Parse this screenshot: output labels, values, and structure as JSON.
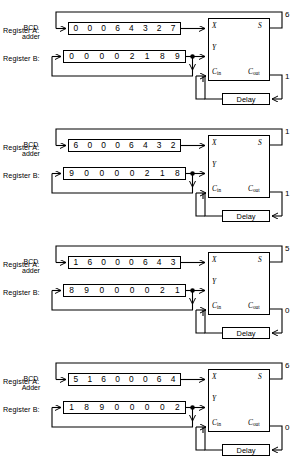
{
  "diagram": {
    "register_a_label": "Register A:",
    "register_b_label": "Register B:",
    "delay_label": "Delay",
    "ports": {
      "x": "X",
      "y": "Y",
      "c_in_main": "C",
      "c_in_sub": "in",
      "s": "S",
      "c_out_main": "C",
      "c_out_sub": "out"
    },
    "blocks": [
      {
        "adder_label_line1": "BCD",
        "adder_label_line2": "adder",
        "register_a": [
          "0",
          "0",
          "0",
          "6",
          "4",
          "3",
          "2",
          "7"
        ],
        "register_b": [
          "0",
          "0",
          "0",
          "0",
          "2",
          "1",
          "8",
          "9"
        ],
        "sum_out": "6",
        "carry_out": "1"
      },
      {
        "adder_label_line1": "BCD",
        "adder_label_line2": "adder",
        "register_a": [
          "6",
          "0",
          "0",
          "0",
          "6",
          "4",
          "3",
          "2"
        ],
        "register_b": [
          "9",
          "0",
          "0",
          "0",
          "0",
          "2",
          "1",
          "8"
        ],
        "sum_out": "1",
        "carry_out": "1"
      },
      {
        "adder_label_line1": "BCD",
        "adder_label_line2": "adder",
        "register_a": [
          "1",
          "6",
          "0",
          "0",
          "0",
          "6",
          "4",
          "3"
        ],
        "register_b": [
          "8",
          "9",
          "0",
          "0",
          "0",
          "0",
          "2",
          "1"
        ],
        "sum_out": "5",
        "carry_out": "0"
      },
      {
        "adder_label_line1": "BCD",
        "adder_label_line2": "Adder",
        "register_a": [
          "5",
          "1",
          "6",
          "0",
          "0",
          "0",
          "6",
          "4"
        ],
        "register_b": [
          "1",
          "8",
          "9",
          "0",
          "0",
          "0",
          "0",
          "2"
        ],
        "sum_out": "6",
        "carry_out": "0"
      }
    ],
    "colors": {
      "line": "#000000",
      "background": "#ffffff"
    }
  }
}
